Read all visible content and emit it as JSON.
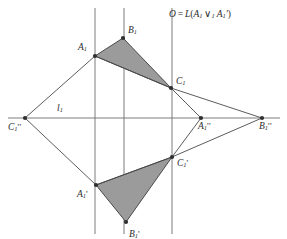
{
  "figure": {
    "caption_formula": {
      "prefix": "O",
      "equals": "=",
      "func": "L",
      "open": "(",
      "arg1": "A",
      "arg1_sub": "1",
      "join": "∨",
      "join_sub": "1",
      "arg2": "A",
      "arg2_sub": "1",
      "arg2_prime": "'",
      "close": ")",
      "full_text": "O = L(A1 ∨1 A1')"
    },
    "line_label": {
      "name": "l",
      "sub": "1"
    },
    "colors": {
      "background": "#ffffff",
      "stroke": "#6e6e6e",
      "stroke_dark": "#4a4a4a",
      "fill_triangle": "#9b9b9b",
      "vertex": "#2f2f2f",
      "text": "#2b2b2b"
    },
    "points": [
      {
        "id": "A1",
        "base": "A",
        "sub": "1",
        "prime": "",
        "x": 95,
        "y": 56,
        "label_dx": -17,
        "label_dy": -13
      },
      {
        "id": "B1",
        "base": "B",
        "sub": "1",
        "prime": "",
        "x": 123,
        "y": 38,
        "label_dx": 5,
        "label_dy": -12
      },
      {
        "id": "C1",
        "base": "C",
        "sub": "1",
        "prime": "",
        "x": 171,
        "y": 88,
        "label_dx": 5,
        "label_dy": -11
      },
      {
        "id": "C1pp",
        "base": "C",
        "sub": "1",
        "prime": "''",
        "x": 25,
        "y": 118,
        "label_dx": -17,
        "label_dy": 5
      },
      {
        "id": "A1pp",
        "base": "A",
        "sub": "1",
        "prime": "''",
        "x": 201,
        "y": 118,
        "label_dx": -3,
        "label_dy": 4
      },
      {
        "id": "B1pp",
        "base": "B",
        "sub": "1",
        "prime": "''",
        "x": 262,
        "y": 118,
        "label_dx": -3,
        "label_dy": 4
      },
      {
        "id": "C1p",
        "base": "C",
        "sub": "1",
        "prime": "'",
        "x": 172,
        "y": 157,
        "label_dx": 5,
        "label_dy": 2
      },
      {
        "id": "A1p",
        "base": "A",
        "sub": "1",
        "prime": "'",
        "x": 96,
        "y": 185,
        "label_dx": -19,
        "label_dy": 5
      },
      {
        "id": "B1p",
        "base": "B",
        "sub": "1",
        "prime": "'",
        "x": 126,
        "y": 222,
        "label_dx": 3,
        "label_dy": 8
      }
    ],
    "vertical_lines": [
      {
        "x": 95,
        "y1": 8,
        "y2": 234
      },
      {
        "x": 124,
        "y1": 8,
        "y2": 234
      },
      {
        "x": 172,
        "y1": 8,
        "y2": 234
      }
    ],
    "horizontal_line": {
      "x1": 8,
      "x2": 280,
      "y": 118
    },
    "triangles": [
      {
        "id": "upper-triangle",
        "vertices": "95,56 123,38 171,88"
      },
      {
        "id": "lower-triangle",
        "vertices": "96,185 126,222 172,157"
      }
    ],
    "segments": [
      {
        "id": "C1pp-A1",
        "x1": 25,
        "y1": 118,
        "x2": 95,
        "y2": 56
      },
      {
        "id": "A1-C1",
        "x1": 95,
        "y1": 56,
        "x2": 171,
        "y2": 88
      },
      {
        "id": "C1-B1pp",
        "x1": 171,
        "y1": 88,
        "x2": 262,
        "y2": 118
      },
      {
        "id": "C1-A1pp",
        "x1": 171,
        "y1": 88,
        "x2": 201,
        "y2": 118
      },
      {
        "id": "C1p-A1pp",
        "x1": 172,
        "y1": 157,
        "x2": 201,
        "y2": 118
      },
      {
        "id": "C1p-B1pp",
        "x1": 172,
        "y1": 157,
        "x2": 262,
        "y2": 118
      },
      {
        "id": "C1pp-A1p",
        "x1": 25,
        "y1": 118,
        "x2": 96,
        "y2": 185
      },
      {
        "id": "A1p-C1p",
        "x1": 96,
        "y1": 185,
        "x2": 172,
        "y2": 157
      }
    ]
  }
}
